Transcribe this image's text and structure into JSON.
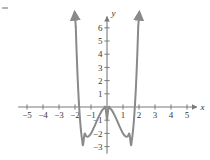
{
  "figure": {
    "background_color": "#ffffff",
    "axis_color": "#7a7a7a",
    "curve_color": "#8a8a8a",
    "label_color": "#3a3a3a",
    "artifact": {
      "name": "scan-dash",
      "x": 2,
      "y": 7,
      "width": 6,
      "height": 2,
      "color": "#9a9a9a"
    }
  },
  "axes": {
    "x_axis_label": "x",
    "y_axis_label": "y",
    "origin_px": {
      "x": 107,
      "y": 107
    },
    "unit_px": {
      "x": 16.0,
      "y": 13.2
    },
    "x_ticks": [
      -5,
      -4,
      -3,
      -2,
      -1,
      1,
      2,
      3,
      4,
      5
    ],
    "x_tick_labels": [
      "−5",
      "−4",
      "−3",
      "−2",
      "−1",
      "1",
      "2",
      "3",
      "4",
      "5"
    ],
    "y_ticks": [
      -3,
      -2,
      -1,
      1,
      2,
      3,
      4,
      5,
      6
    ],
    "y_tick_labels": [
      "−3",
      "−2",
      "−1",
      "1",
      "2",
      "3",
      "4",
      "5",
      "6"
    ],
    "x_arrow": true,
    "y_arrow": true
  },
  "chart_data": {
    "type": "line",
    "title": "",
    "xlabel": "x",
    "ylabel": "y",
    "xlim": [
      -5.6,
      5.9
    ],
    "ylim": [
      -3.6,
      7.1
    ],
    "grid": false,
    "legend": null,
    "series": [
      {
        "name": "quartic",
        "equation": "y = x^4 - 3x^2 - 1",
        "curve_color": "#8a8a8a",
        "end_arrows": [
          "up-left",
          "up-right"
        ],
        "local_maximum": {
          "x": 0,
          "y": -1
        },
        "local_minima": [
          {
            "x": -1.3,
            "y": -2
          },
          {
            "x": 1.3,
            "y": -2
          }
        ],
        "x_intercepts": [
          -1.76,
          -0.56,
          0.56,
          1.76
        ],
        "x": [
          -1.95,
          -1.9,
          -1.85,
          -1.8,
          -1.75,
          -1.7,
          -1.65,
          -1.6,
          -1.55,
          -1.5,
          -1.4,
          -1.3,
          -1.2,
          -1.1,
          -1.0,
          -0.9,
          -0.8,
          -0.7,
          -0.6,
          -0.5,
          -0.4,
          -0.3,
          -0.2,
          -0.1,
          0.0,
          0.1,
          0.2,
          0.3,
          0.4,
          0.5,
          0.6,
          0.7,
          0.8,
          0.9,
          1.0,
          1.1,
          1.2,
          1.3,
          1.4,
          1.5,
          1.55,
          1.6,
          1.65,
          1.7,
          1.75,
          1.8,
          1.85,
          1.9,
          1.95
        ],
        "y": [
          6.05,
          4.21,
          2.64,
          1.31,
          0.19,
          -0.73,
          -1.48,
          -2.07,
          -2.53,
          -2.88,
          -2.04,
          -2.22,
          -2.25,
          -2.16,
          -2.0,
          -1.77,
          -1.51,
          -1.23,
          -0.95,
          -0.69,
          -0.45,
          -0.24,
          -0.11,
          -0.03,
          -1.0,
          -0.03,
          -0.11,
          -0.24,
          -0.45,
          -0.69,
          -0.95,
          -1.23,
          -1.51,
          -1.77,
          -2.0,
          -2.16,
          -2.25,
          -2.22,
          -2.04,
          -2.88,
          -2.53,
          -2.07,
          -1.48,
          -0.73,
          0.19,
          1.31,
          2.64,
          4.21,
          6.05
        ]
      }
    ]
  }
}
